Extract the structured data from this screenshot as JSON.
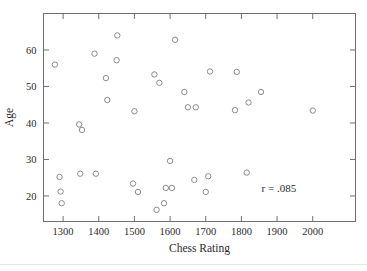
{
  "figure": {
    "name": "chess-rating-age-scatterplot",
    "annotation": "r = .085",
    "frame_color": "#6f6f73",
    "marker_color": "#8a8a90"
  },
  "chart_data": {
    "type": "scatter",
    "title": "",
    "xlabel": "Chess Rating",
    "ylabel": "Age",
    "xlim": [
      1245,
      2120
    ],
    "ylim": [
      13,
      70
    ],
    "grid": false,
    "legend": null,
    "xticks": [
      1300,
      1400,
      1500,
      1600,
      1700,
      1800,
      1900,
      2000
    ],
    "xticklabels": [
      "1300",
      "1400",
      "1500",
      "1600",
      "1700",
      "1800",
      "1900",
      "2000"
    ],
    "yticks": [
      20,
      30,
      40,
      50,
      60
    ],
    "yticklabels": [
      "20",
      "30",
      "40",
      "50",
      "60"
    ],
    "annotations": [
      {
        "text": "r = .085",
        "x": 1905,
        "y": 21
      }
    ],
    "series": [
      {
        "name": "players",
        "marker": "open-circle",
        "x": [
          1277,
          1290,
          1293,
          1296,
          1345,
          1348,
          1353,
          1388,
          1392,
          1420,
          1424,
          1450,
          1452,
          1496,
          1500,
          1510,
          1556,
          1562,
          1570,
          1583,
          1588,
          1600,
          1605,
          1614,
          1640,
          1650,
          1668,
          1672,
          1700,
          1707,
          1712,
          1782,
          1787,
          1815,
          1820,
          1855,
          2000
        ],
        "y": [
          56.0,
          25.2,
          21.2,
          18.0,
          39.6,
          26.1,
          38.1,
          59.0,
          26.1,
          52.3,
          46.3,
          57.2,
          64.0,
          23.4,
          43.2,
          21.1,
          53.3,
          16.2,
          51.0,
          18.0,
          22.2,
          29.6,
          22.2,
          62.8,
          48.5,
          44.3,
          24.4,
          44.3,
          21.1,
          25.4,
          54.1,
          43.5,
          54.0,
          26.4,
          45.6,
          48.5,
          43.4
        ]
      }
    ]
  }
}
